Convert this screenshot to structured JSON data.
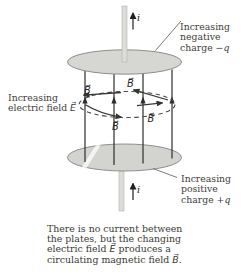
{
  "colors": {
    "plate_fill": "#d6d6d3",
    "plate_fill_bottom": "#d3d3d0",
    "plate_outline": "#8e8e8b",
    "wire_fill": "#dcdcd9",
    "field_line": "#2d2d2d",
    "b_loop": "#4a4a4a",
    "text": "#3d3d37"
  },
  "figure": {
    "current_label": "i",
    "b_label": "B⃗",
    "labels": {
      "top_right": {
        "line1": "Increasing",
        "line2": "negative",
        "line3_text": "charge ",
        "line3_symbol": "−q"
      },
      "left": {
        "line1": "Increasing",
        "line2_text": "electric field ",
        "line2_symbol": "E⃗"
      },
      "bottom_right": {
        "line1": "Increasing",
        "line2": "positive",
        "line3_text": "charge ",
        "line3_symbol": "+q"
      }
    }
  },
  "caption": {
    "line1": "There is no current between",
    "line2": "the plates, but the changing",
    "line3_text": "electric field ",
    "line3_symbol": "E⃗",
    "line3_rest": " produces a",
    "line4_text": "circulating magnetic field ",
    "line4_symbol": "B⃗",
    "line4_rest": "."
  }
}
